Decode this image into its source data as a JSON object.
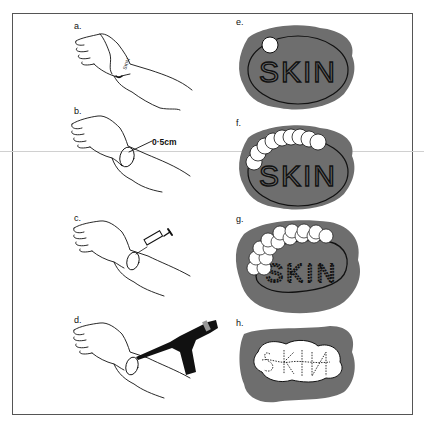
{
  "figure": {
    "left_column": {
      "panels": [
        {
          "id": "a",
          "label": "a.",
          "content": "hand with SKIN marking on wrist"
        },
        {
          "id": "b",
          "label": "b.",
          "content": "hand with circled area on wrist",
          "annotation": "0·5cm"
        },
        {
          "id": "c",
          "label": "c.",
          "content": "syringe injecting at circled wrist area"
        },
        {
          "id": "d",
          "label": "d.",
          "content": "handheld device applied to circled wrist area"
        }
      ]
    },
    "right_column": {
      "panels": [
        {
          "id": "e",
          "label": "e.",
          "word": "SKIN",
          "circles": 1
        },
        {
          "id": "f",
          "label": "f.",
          "word": "SKIN",
          "circles": 9
        },
        {
          "id": "g",
          "label": "g.",
          "word": "SKIN",
          "circles": 16
        },
        {
          "id": "h",
          "label": "h.",
          "word": "SKIN",
          "circles": 0
        }
      ]
    },
    "colors": {
      "patch_gray": "#6e6e6e",
      "ink": "#111111",
      "frame": "#555555",
      "background": "#ffffff"
    }
  }
}
